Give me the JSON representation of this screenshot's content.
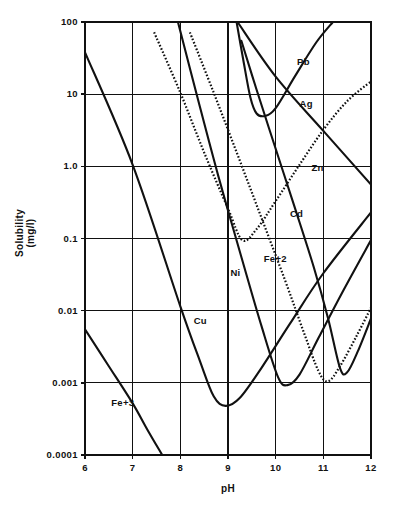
{
  "chart_data": {
    "type": "line",
    "title": "",
    "xlabel": "pH",
    "ylabel": "Solubility\n(mg/l)",
    "ylabel_line1": "Solubility",
    "ylabel_line2": "(mg/l)",
    "xlim": [
      6,
      12
    ],
    "ylim": [
      0.0001,
      100
    ],
    "yscale": "log",
    "xscale": "linear",
    "grid": true,
    "legend": "inline-labels",
    "xticks": [
      "6",
      "7",
      "8",
      "9",
      "10",
      "11",
      "12"
    ],
    "xtick_values": [
      6,
      7,
      8,
      9,
      10,
      11,
      12
    ],
    "yticks": [
      "100",
      "10",
      "1.0",
      "0.1",
      "0.01",
      "0.001",
      "0.0001"
    ],
    "ytick_values": [
      100,
      10,
      1.0,
      0.1,
      0.01,
      0.001,
      0.0001
    ],
    "series": [
      {
        "name": "Fe+3",
        "label": "Fe+3",
        "style": "solid",
        "label_x": 6.55,
        "label_y": 0.00052,
        "points": [
          {
            "x": 6.0,
            "y": 0.0055
          },
          {
            "x": 6.5,
            "y": 0.0017
          },
          {
            "x": 7.0,
            "y": 0.00052
          },
          {
            "x": 7.3,
            "y": 0.00023
          },
          {
            "x": 7.62,
            "y": 0.0001
          }
        ]
      },
      {
        "name": "Cu",
        "label": "Cu",
        "style": "solid",
        "label_x": 8.28,
        "label_y": 0.0072,
        "points": [
          {
            "x": 6.0,
            "y": 38
          },
          {
            "x": 7.0,
            "y": 1.05
          },
          {
            "x": 8.0,
            "y": 0.0115
          },
          {
            "x": 8.4,
            "y": 0.0021
          },
          {
            "x": 8.7,
            "y": 0.00065
          },
          {
            "x": 8.95,
            "y": 0.00048
          },
          {
            "x": 9.25,
            "y": 0.00062
          },
          {
            "x": 9.7,
            "y": 0.0016
          },
          {
            "x": 10.3,
            "y": 0.0066
          },
          {
            "x": 11.0,
            "y": 0.033
          },
          {
            "x": 12.0,
            "y": 0.23
          }
        ]
      },
      {
        "name": "Ni",
        "label": "Ni",
        "style": "solid",
        "label_x": 9.05,
        "label_y": 0.033,
        "points": [
          {
            "x": 7.95,
            "y": 100
          },
          {
            "x": 8.35,
            "y": 9.5
          },
          {
            "x": 8.8,
            "y": 0.72
          },
          {
            "x": 9.3,
            "y": 0.05
          },
          {
            "x": 9.7,
            "y": 0.0062
          },
          {
            "x": 10.05,
            "y": 0.0012
          },
          {
            "x": 10.25,
            "y": 0.00093
          },
          {
            "x": 10.5,
            "y": 0.0013
          },
          {
            "x": 10.9,
            "y": 0.0042
          },
          {
            "x": 11.4,
            "y": 0.018
          },
          {
            "x": 12.0,
            "y": 0.095
          }
        ]
      },
      {
        "name": "Zn",
        "label": "Zn",
        "style": "dotted",
        "label_x": 10.75,
        "label_y": 0.95,
        "points": [
          {
            "x": 7.45,
            "y": 72
          },
          {
            "x": 8.0,
            "y": 10.5
          },
          {
            "x": 8.5,
            "y": 1.55
          },
          {
            "x": 9.0,
            "y": 0.26
          },
          {
            "x": 9.3,
            "y": 0.095
          },
          {
            "x": 9.6,
            "y": 0.135
          },
          {
            "x": 10.0,
            "y": 0.33
          },
          {
            "x": 10.5,
            "y": 1.05
          },
          {
            "x": 11.0,
            "y": 3.2
          },
          {
            "x": 11.5,
            "y": 8.0
          },
          {
            "x": 12.0,
            "y": 15.0
          }
        ]
      },
      {
        "name": "Fe+2",
        "label": "Fe+2",
        "style": "dotted",
        "label_x": 9.75,
        "label_y": 0.052,
        "points": [
          {
            "x": 8.2,
            "y": 72
          },
          {
            "x": 8.7,
            "y": 10.5
          },
          {
            "x": 9.2,
            "y": 1.45
          },
          {
            "x": 9.7,
            "y": 0.195
          },
          {
            "x": 10.2,
            "y": 0.026
          },
          {
            "x": 10.6,
            "y": 0.0048
          },
          {
            "x": 10.9,
            "y": 0.00145
          },
          {
            "x": 11.1,
            "y": 0.00105
          },
          {
            "x": 11.35,
            "y": 0.0017
          },
          {
            "x": 11.7,
            "y": 0.0045
          },
          {
            "x": 12.0,
            "y": 0.011
          }
        ]
      },
      {
        "name": "Pb",
        "label": "Pb",
        "style": "solid",
        "label_x": 10.45,
        "label_y": 28,
        "points": [
          {
            "x": 9.18,
            "y": 100
          },
          {
            "x": 9.32,
            "y": 30
          },
          {
            "x": 9.47,
            "y": 9.0
          },
          {
            "x": 9.6,
            "y": 5.4
          },
          {
            "x": 9.78,
            "y": 5.0
          },
          {
            "x": 10.0,
            "y": 6.4
          },
          {
            "x": 10.4,
            "y": 17.5
          },
          {
            "x": 10.85,
            "y": 52
          },
          {
            "x": 11.2,
            "y": 100
          }
        ]
      },
      {
        "name": "Cd",
        "label": "Cd",
        "style": "solid",
        "label_x": 10.3,
        "label_y": 0.22,
        "points": [
          {
            "x": 9.28,
            "y": 55
          },
          {
            "x": 9.6,
            "y": 11.5
          },
          {
            "x": 10.0,
            "y": 1.75
          },
          {
            "x": 10.4,
            "y": 0.27
          },
          {
            "x": 10.8,
            "y": 0.04
          },
          {
            "x": 11.1,
            "y": 0.0078
          },
          {
            "x": 11.35,
            "y": 0.0016
          },
          {
            "x": 11.5,
            "y": 0.0014
          },
          {
            "x": 11.72,
            "y": 0.0027
          },
          {
            "x": 12.0,
            "y": 0.0078
          }
        ]
      },
      {
        "name": "Ag",
        "label": "Ag",
        "style": "solid",
        "label_x": 10.5,
        "label_y": 7.2,
        "points": [
          {
            "x": 9.2,
            "y": 100
          },
          {
            "x": 10.0,
            "y": 17.5
          },
          {
            "x": 11.0,
            "y": 3.1
          },
          {
            "x": 12.0,
            "y": 0.56
          }
        ]
      }
    ]
  },
  "geometry": {
    "plot_left": 85,
    "plot_right": 371,
    "plot_top": 22,
    "plot_bottom": 455,
    "axis_color": "#111111"
  }
}
